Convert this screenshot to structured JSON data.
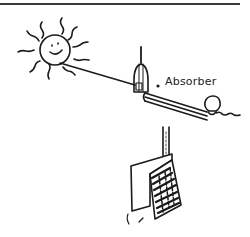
{
  "diagram": {
    "labels": {
      "absorber": "Absorber"
    },
    "elements": [
      {
        "id": "sun",
        "description": "smiling sun with wavy rays"
      },
      {
        "id": "sun-ray",
        "description": "line from sun to absorber"
      },
      {
        "id": "absorber",
        "description": "absorber unit atop tilted pipe"
      },
      {
        "id": "tilted-pipe",
        "description": "double-line pipe running down-right"
      },
      {
        "id": "bulb",
        "description": "round bulb at end of pipe"
      },
      {
        "id": "vertical-pipe",
        "description": "vertical pipe leading down"
      },
      {
        "id": "panel",
        "description": "folded panel / plate with hatched side"
      }
    ],
    "colors": {
      "stroke": "#1a1a1a",
      "background": "#ffffff",
      "rule": "#3a3a3a"
    }
  }
}
